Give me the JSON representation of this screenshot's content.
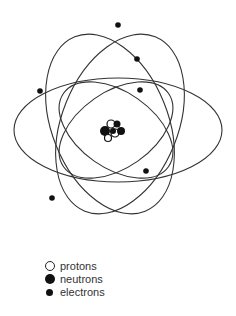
{
  "diagram": {
    "title": "",
    "nucleus": {
      "center": [
        111,
        131
      ],
      "particles": [
        {
          "type": "neutron",
          "x": 105,
          "y": 131,
          "r": 5
        },
        {
          "type": "proton",
          "x": 111,
          "y": 124,
          "r": 4
        },
        {
          "type": "neutron",
          "x": 117,
          "y": 124,
          "r": 3.5
        },
        {
          "type": "proton",
          "x": 115,
          "y": 133,
          "r": 4
        },
        {
          "type": "neutron",
          "x": 121,
          "y": 131,
          "r": 4
        },
        {
          "type": "proton",
          "x": 108,
          "y": 138,
          "r": 3.5
        },
        {
          "type": "neutron",
          "x": 113,
          "y": 131,
          "r": 3
        }
      ]
    },
    "orbits": [
      {
        "name": "wide-horizontal",
        "cx": 118,
        "cy": 130,
        "rx": 104,
        "ry": 52,
        "rotate": 0
      },
      {
        "name": "tall-left-tilt",
        "cx": 110,
        "cy": 124,
        "rx": 58,
        "ry": 94,
        "rotate": -22
      },
      {
        "name": "tall-right-tilt",
        "cx": 120,
        "cy": 124,
        "rx": 58,
        "ry": 94,
        "rotate": 22
      },
      {
        "name": "inner-left-tilt",
        "cx": 116,
        "cy": 130,
        "rx": 64,
        "ry": 38,
        "rotate": -35
      },
      {
        "name": "inner-right-tilt",
        "cx": 116,
        "cy": 130,
        "rx": 64,
        "ry": 38,
        "rotate": 35
      }
    ],
    "electrons": [
      {
        "x": 118,
        "y": 25
      },
      {
        "x": 137,
        "y": 59
      },
      {
        "x": 40,
        "y": 91
      },
      {
        "x": 140,
        "y": 90
      },
      {
        "x": 146,
        "y": 171
      },
      {
        "x": 52,
        "y": 198
      }
    ],
    "colors": {
      "line": "#333333",
      "particle": "#111111",
      "background": "#ffffff"
    }
  },
  "legend": {
    "items": [
      {
        "symbol": "proton",
        "label": "protons"
      },
      {
        "symbol": "neutron",
        "label": "neutrons"
      },
      {
        "symbol": "electron",
        "label": "electrons"
      }
    ]
  }
}
